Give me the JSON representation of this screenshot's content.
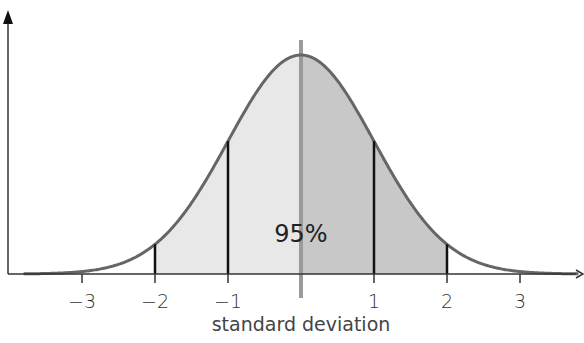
{
  "chart_data": {
    "type": "area",
    "title": "",
    "xlabel": "standard deviation",
    "ylabel": "",
    "distribution": "normal",
    "mean": 0,
    "sd": 1,
    "xlim": [
      -4,
      4
    ],
    "ticks": [
      -3,
      -2,
      -1,
      1,
      2,
      3
    ],
    "tick_labels": [
      "−3",
      "−2",
      "−1",
      "1",
      "2",
      "3"
    ],
    "shaded_interval": [
      -2,
      2
    ],
    "annotation": "95%",
    "vertical_markers": [
      -2,
      -1,
      1,
      2
    ],
    "center_line": 0,
    "colors": {
      "curve": "#666666",
      "left_fill": "#e8e8e8",
      "right_fill": "#c8c8c8",
      "center_line": "#9a9a9a",
      "markers": "#111111",
      "axis": "#333333"
    },
    "grid": false,
    "legend": null
  },
  "labels": {
    "annotation": "95%",
    "xlabel": "standard deviation"
  }
}
